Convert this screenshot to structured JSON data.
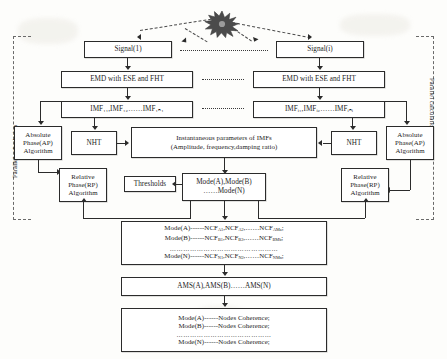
{
  "figure": {
    "source_icon": "starburst-source-icon",
    "accent_color": "#2b2b2b",
    "frame_color": "#6a6a6a"
  },
  "labels": {
    "parallel_left": "Parallel calculation",
    "parallel_right": "Parallel calculation"
  },
  "branches": {
    "left": {
      "signal": "Signal(1)",
      "emd": "EMD with ESE and FHT",
      "imf": "IMF₁₁,IMF₁₂……IMF₁ₙ₁",
      "imf_plain": "IMF11,IMF12......IMF1n1",
      "nht": "NHT",
      "ap_lines": [
        "Absolute",
        "Phase(AP)",
        "Algorithm"
      ],
      "rp_lines": [
        "Relative",
        "Phase(RP)",
        "Algorithm"
      ]
    },
    "right": {
      "signal": "Signal(i)",
      "emd": "EMD with ESE and FHT",
      "imf": "IMFᵢ₁,IMFᵢ₂……IMFᵢₙᵢ",
      "imf_plain": "IMFi1,IMFi2......IMFini",
      "nht": "NHT",
      "ap_lines": [
        "Absolute",
        "Phase(AP)",
        "Algorithm"
      ],
      "rp_lines": [
        "Relative",
        "Phase(RP)",
        "Algorithm"
      ]
    }
  },
  "center": {
    "instantaneous": {
      "line1": "Instantaneous parameters of IMFs",
      "line2": "(Amplitude, frequency,damping ratio)"
    },
    "thresholds": "Thresholds",
    "modes": {
      "line1": "Mode(A),Mode(B)",
      "line2": "……Mode(N)"
    },
    "ncf": {
      "line1_prefix": "Mode(A)------NCF",
      "line1": "Mode(A)------NCF_A1,NCF_A2,……NCF_AMa;",
      "line2": "Mode(B)------NCF_B1,NCF_B2,……NCF_BMb;",
      "line3_dots": "…………………………………………",
      "line4": "Mode(N)------NCF_N1,NCF_N2,……NCF_NMn;"
    },
    "ams": "AMS(A),AMS(B)……AMS(N)",
    "coherence": {
      "line1": "Mode(A)------Nodes Coherence;",
      "line2": "Mode(B)------Nodes Coherence;",
      "line3_dots": "……………………………………",
      "line4": "Mode(N)------Nodes Coherence;"
    }
  },
  "ellipsis": {
    "between_signals": "············",
    "between_emd": "·······",
    "between_imf": "·······"
  }
}
